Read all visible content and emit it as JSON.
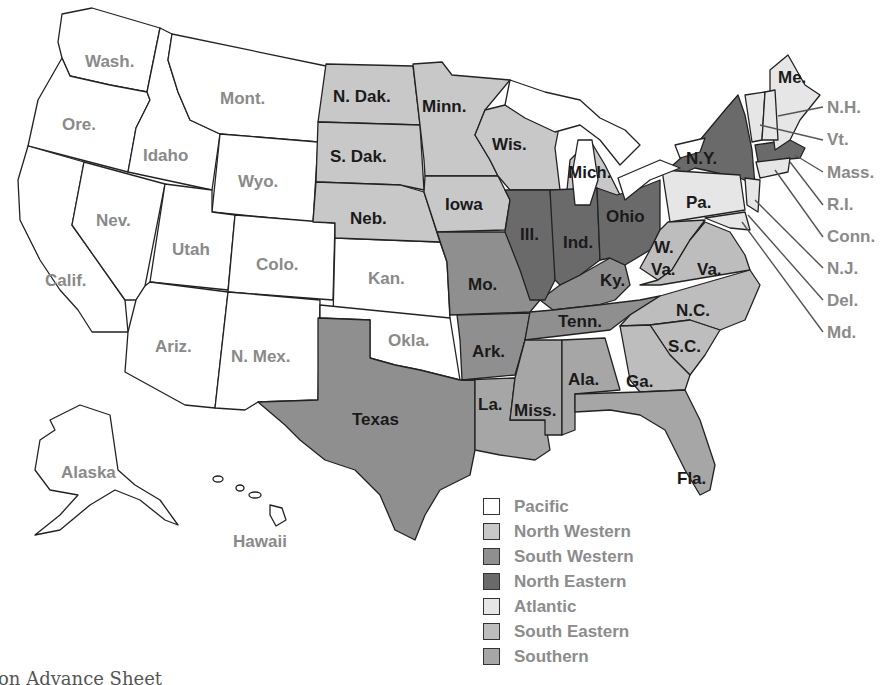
{
  "colors": {
    "pacific": "#ffffff",
    "north_western": "#c8c8c8",
    "south_western": "#8f8f8f",
    "north_eastern": "#6a6a6a",
    "atlantic": "#e6e6e6",
    "south_eastern": "#bdbdbd",
    "southern": "#a6a6a6",
    "water": "#ffffff",
    "border": "#222222"
  },
  "states": {
    "wash": "Wash.",
    "ore": "Ore.",
    "calif": "Calif.",
    "nev": "Nev.",
    "idaho": "Idaho",
    "mont": "Mont.",
    "wyo": "Wyo.",
    "utah": "Utah",
    "colo": "Colo.",
    "ariz": "Ariz.",
    "nmex": "N. Mex.",
    "kan": "Kan.",
    "okla": "Okla.",
    "alaska": "Alaska",
    "hawaii": "Hawaii",
    "ndak": "N. Dak.",
    "sdak": "S. Dak.",
    "neb": "Neb.",
    "minn": "Minn.",
    "iowa": "Iowa",
    "wis": "Wis.",
    "mich": "Mich.",
    "texas": "Texas",
    "mo": "Mo.",
    "ark": "Ark.",
    "la": "La.",
    "ky": "Ky.",
    "tenn": "Tenn.",
    "ill": "Ill.",
    "ind": "Ind.",
    "ohio": "Ohio",
    "ny": "N.Y.",
    "mass": "Mass.",
    "pa": "Pa.",
    "me": "Me.",
    "nh": "N.H.",
    "vt": "Vt.",
    "ri": "R.I.",
    "conn": "Conn.",
    "nj": "N.J.",
    "del": "Del.",
    "md": "Md.",
    "wva1": "W.",
    "wva2": "Va.",
    "va": "Va.",
    "nc": "N.C.",
    "sc": "S.C.",
    "ga": "Ga.",
    "ala": "Ala.",
    "miss": "Miss.",
    "fla": "Fla."
  },
  "legend": [
    {
      "key": "pacific",
      "label": "Pacific",
      "color": "#ffffff"
    },
    {
      "key": "north_western",
      "label": "North Western",
      "color": "#c8c8c8"
    },
    {
      "key": "south_western",
      "label": "South Western",
      "color": "#8f8f8f"
    },
    {
      "key": "north_eastern",
      "label": "North Eastern",
      "color": "#6a6a6a"
    },
    {
      "key": "atlantic",
      "label": "Atlantic",
      "color": "#e6e6e6"
    },
    {
      "key": "south_eastern",
      "label": "South Eastern",
      "color": "#bdbdbd"
    },
    {
      "key": "southern",
      "label": "Southern",
      "color": "#a6a6a6"
    }
  ],
  "footer": "on Advance Sheet"
}
